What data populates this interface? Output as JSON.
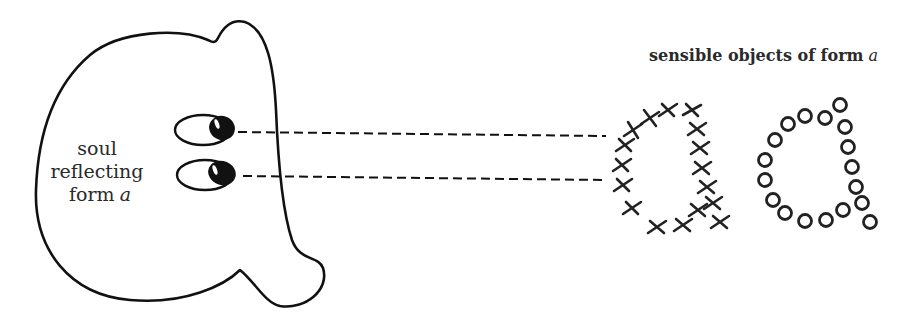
{
  "diagram": {
    "soul": {
      "label_lines": [
        "soul",
        "reflecting",
        "form"
      ],
      "form_letter": "a"
    },
    "objects": {
      "title_prefix": "sensible objects of form",
      "form_letter": "a",
      "groups": [
        {
          "name": "crosses",
          "marker": "×",
          "shape": "letter-a"
        },
        {
          "name": "circles",
          "marker": "○",
          "shape": "letter-a"
        }
      ]
    },
    "connections": [
      {
        "from": "upper-eye",
        "to": "sensible-objects",
        "style": "dashed"
      },
      {
        "from": "lower-eye",
        "to": "sensible-objects",
        "style": "dashed"
      }
    ],
    "colors": {
      "stroke": "#111111",
      "background": "#ffffff"
    }
  }
}
